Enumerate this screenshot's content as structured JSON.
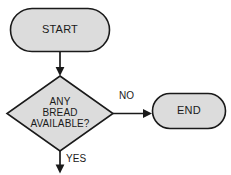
{
  "diagram": {
    "type": "flowchart",
    "background_color": "#ffffff",
    "node_fill_color": "#dcdcdc",
    "node_stroke_color": "#1a1a1a",
    "nodes": [
      {
        "id": "start",
        "shape": "terminator",
        "label": "START"
      },
      {
        "id": "decision",
        "shape": "diamond",
        "label_lines": [
          "ANY",
          "BREAD",
          "AVAILABLE?"
        ],
        "line1": "ANY",
        "line2": "BREAD",
        "line3": "AVAILABLE?"
      },
      {
        "id": "end",
        "shape": "terminator",
        "label": "END"
      }
    ],
    "edges": [
      {
        "id": "start-to-decision",
        "from": "start",
        "to": "decision",
        "label": ""
      },
      {
        "id": "decision-to-end",
        "from": "decision",
        "to": "end",
        "label": "NO"
      },
      {
        "id": "decision-yes",
        "from": "decision",
        "to": "",
        "label": "YES"
      }
    ]
  }
}
